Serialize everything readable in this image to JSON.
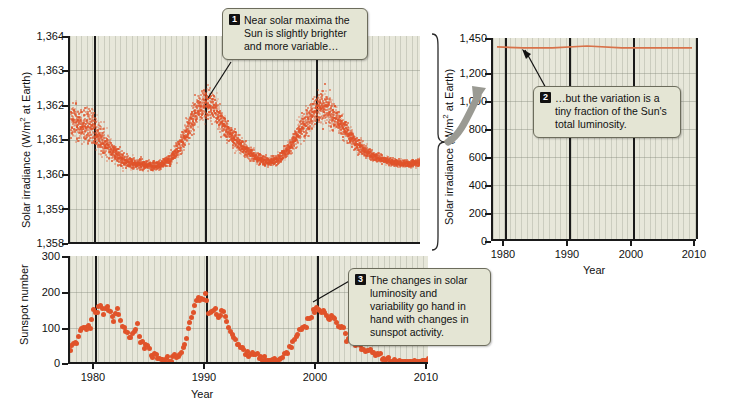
{
  "figure": {
    "palette": {
      "plot_background": "#e7e7da",
      "data_points": "#e0532a",
      "axis": "#1a1a1a",
      "callout_background": "#e4e5d4",
      "callout_border": "#6c6c5c",
      "arrow_gray": "#9a9a93"
    }
  },
  "callouts": [
    {
      "number": "1",
      "text": "Near solar maxima the Sun is slightly brighter and more variable…"
    },
    {
      "number": "2",
      "text": "…but the variation is a tiny fraction of the Sun's total luminosity."
    },
    {
      "number": "3",
      "text": "The changes in solar luminosity and variability go hand in hand with changes in sunspot activity."
    }
  ],
  "chart_data": [
    {
      "id": "irradiance-zoomed",
      "type": "scatter",
      "title": "",
      "xlabel": "",
      "ylabel": "Solar irradiance (W/m2 at Earth)",
      "ylabel_display": "Solar irradiance (W/m² at Earth)",
      "xlim": [
        1978,
        2010
      ],
      "ylim": [
        1358,
        1364
      ],
      "yticks": [
        "1,364",
        "1,363",
        "1,362",
        "1,361",
        "1,360",
        "1,359",
        "1,358"
      ],
      "ytick_values": [
        1364,
        1363,
        1362,
        1361,
        1360,
        1359,
        1358
      ],
      "xticks": [
        "1980",
        "1990",
        "2000",
        "2010"
      ],
      "xtick_values": [
        1980,
        1990,
        2000,
        2010
      ],
      "grid": "vertical-minor-and-horizontal",
      "legend": "none",
      "note": "Daily total solar irradiance; scatter cloud tracing ~11-year solar cycles with maxima near 1980, 1990 and 2001 reaching ~1362.3 and minima near 1986 and 1996 near 1360.3",
      "series": [
        {
          "name": "Total solar irradiance",
          "color": "#e0532a",
          "envelope_years": [
            1978,
            1979,
            1980,
            1981,
            1982,
            1983,
            1984,
            1985,
            1986,
            1987,
            1988,
            1989,
            1990,
            1991,
            1992,
            1993,
            1994,
            1995,
            1996,
            1997,
            1998,
            1999,
            2000,
            2001,
            2002,
            2003,
            2004,
            2005,
            2006,
            2007,
            2008,
            2009,
            2010
          ],
          "envelope_mean": [
            1361.6,
            1361.5,
            1361.3,
            1361.0,
            1360.6,
            1360.4,
            1360.35,
            1360.3,
            1360.3,
            1360.45,
            1360.9,
            1361.6,
            1362.1,
            1362.0,
            1361.4,
            1361.0,
            1360.7,
            1360.5,
            1360.4,
            1360.5,
            1360.9,
            1361.4,
            1361.8,
            1362.0,
            1361.7,
            1361.3,
            1360.9,
            1360.65,
            1360.5,
            1360.4,
            1360.35,
            1360.35,
            1360.4
          ],
          "envelope_spread": [
            1.0,
            1.0,
            0.9,
            0.8,
            0.55,
            0.35,
            0.3,
            0.25,
            0.25,
            0.3,
            0.5,
            0.8,
            0.9,
            0.85,
            0.6,
            0.45,
            0.35,
            0.3,
            0.25,
            0.3,
            0.45,
            0.7,
            0.85,
            0.9,
            0.75,
            0.55,
            0.4,
            0.3,
            0.25,
            0.2,
            0.18,
            0.18,
            0.2
          ]
        }
      ]
    },
    {
      "id": "irradiance-full-scale",
      "type": "line",
      "title": "",
      "xlabel": "Year",
      "ylabel": "Solar irradiance (W/m2 at Earth)",
      "ylabel_display": "Solar irradiance (W/m² at Earth)",
      "xlim": [
        1978,
        2010
      ],
      "ylim": [
        0,
        1450
      ],
      "yticks": [
        "1,450",
        "1,200",
        "1,000",
        "800",
        "600",
        "400",
        "200",
        "0"
      ],
      "ytick_values": [
        1450,
        1200,
        1000,
        800,
        600,
        400,
        200,
        0
      ],
      "xticks": [
        "1980",
        "1990",
        "2000",
        "2010"
      ],
      "xtick_values": [
        1980,
        1990,
        2000,
        2010
      ],
      "grid": "vertical-minor-and-horizontal",
      "legend": "none",
      "note": "Same irradiance data plotted on a full zero-based scale: the line appears flat at about 1,361 W/m2",
      "series": [
        {
          "name": "Total solar irradiance",
          "color": "#d8724a",
          "x": [
            1978,
            1982,
            1986,
            1990,
            1994,
            1998,
            2002,
            2006,
            2010
          ],
          "y": [
            1361,
            1360.6,
            1360.3,
            1362.1,
            1360.7,
            1360.9,
            1361.7,
            1360.5,
            1360.4
          ]
        }
      ]
    },
    {
      "id": "sunspot-number",
      "type": "scatter",
      "title": "",
      "xlabel": "Year",
      "ylabel": "Sunspot number",
      "xlim": [
        1978,
        2010
      ],
      "ylim": [
        0,
        300
      ],
      "yticks": [
        "300",
        "200",
        "100",
        "0"
      ],
      "ytick_values": [
        300,
        200,
        100,
        0
      ],
      "xticks": [
        "1980",
        "1990",
        "2000",
        "2010"
      ],
      "xtick_values": [
        1980,
        1990,
        2000,
        2010
      ],
      "grid": "vertical-minor-and-horizontal",
      "legend": "none",
      "note": "Monthly smoothed sunspot number; maxima near 1979-1981 (~190), 1989-1991 (~200) and 2000-2002 (~170), minima near 1986 and 1996 and 2008-2009 (~0-15)",
      "series": [
        {
          "name": "Sunspot number",
          "color": "#e0532a",
          "x": [
            1978.0,
            1978.3,
            1978.6,
            1978.9,
            1979.2,
            1979.5,
            1979.8,
            1980.1,
            1980.4,
            1980.7,
            1981.0,
            1981.3,
            1981.6,
            1981.9,
            1982.2,
            1982.5,
            1982.8,
            1983.1,
            1983.4,
            1983.7,
            1984.0,
            1984.3,
            1984.6,
            1984.9,
            1985.2,
            1985.5,
            1985.8,
            1986.1,
            1986.4,
            1986.7,
            1987.0,
            1987.3,
            1987.6,
            1987.9,
            1988.2,
            1988.5,
            1988.8,
            1989.1,
            1989.4,
            1989.7,
            1990.0,
            1990.3,
            1990.6,
            1990.9,
            1991.2,
            1991.5,
            1991.8,
            1992.1,
            1992.4,
            1992.7,
            1993.0,
            1993.3,
            1993.6,
            1993.9,
            1994.2,
            1994.5,
            1994.8,
            1995.1,
            1995.4,
            1995.7,
            1996.0,
            1996.3,
            1996.6,
            1996.9,
            1997.2,
            1997.5,
            1997.8,
            1998.1,
            1998.4,
            1998.7,
            1999.0,
            1999.3,
            1999.6,
            1999.9,
            2000.2,
            2000.5,
            2000.8,
            2001.1,
            2001.4,
            2001.7,
            2002.0,
            2002.3,
            2002.6,
            2002.9,
            2003.2,
            2003.5,
            2003.8,
            2004.1,
            2004.4,
            2004.7,
            2005.0,
            2005.3,
            2005.6,
            2005.9,
            2006.2,
            2006.5,
            2006.8,
            2007.1,
            2007.4,
            2007.7,
            2008.0,
            2008.3,
            2008.6,
            2008.9,
            2009.2,
            2009.5,
            2009.8,
            2010.0
          ],
          "y": [
            35,
            55,
            60,
            92,
            100,
            103,
            100,
            155,
            150,
            165,
            140,
            160,
            150,
            120,
            150,
            115,
            105,
            85,
            70,
            90,
            110,
            60,
            45,
            50,
            20,
            25,
            18,
            12,
            10,
            14,
            10,
            28,
            20,
            35,
            60,
            100,
            130,
            160,
            180,
            175,
            195,
            145,
            140,
            150,
            130,
            145,
            135,
            100,
            85,
            70,
            55,
            40,
            38,
            25,
            30,
            22,
            18,
            14,
            12,
            13,
            9,
            8,
            12,
            20,
            38,
            45,
            65,
            80,
            95,
            100,
            110,
            125,
            140,
            160,
            150,
            145,
            130,
            120,
            140,
            115,
            105,
            95,
            70,
            80,
            60,
            55,
            48,
            40,
            35,
            38,
            28,
            30,
            22,
            18,
            15,
            12,
            10,
            8,
            6,
            4,
            3,
            2,
            2,
            1,
            3,
            8,
            14,
            20
          ]
        }
      ]
    }
  ]
}
